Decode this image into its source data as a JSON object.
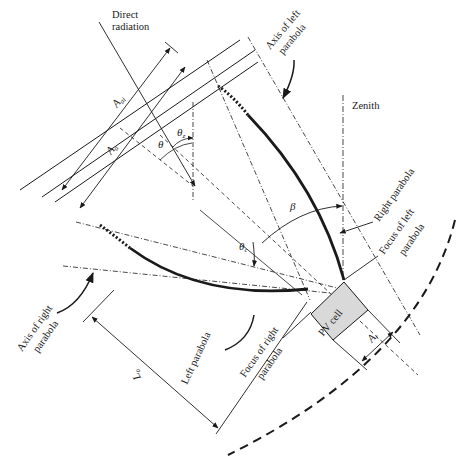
{
  "figure": {
    "background": "#ffffff",
    "line_color": "#1a1a1a",
    "cell_fill": "#d9d9d9"
  },
  "labels": {
    "direct_radiation_1": "Direct",
    "direct_radiation_2": "radiation",
    "axis_left_1": "Axis of left",
    "axis_left_2": "parabola",
    "zenith": "Zenith",
    "right_parabola": "Right parabola",
    "focus_left_1": "Focus of left",
    "focus_left_2": "parabola",
    "axis_right_1": "Axis of right",
    "axis_right_2": "parabola",
    "left_parabola": "Left parabola",
    "focus_right_1": "Focus of right",
    "focus_right_2": "parabola",
    "pv_cell": "PV cell"
  },
  "symbols": {
    "A_ai_main": "A",
    "A_ai_sub": "ai",
    "A_a_main": "A",
    "A_a_sub": "a",
    "theta": "θ",
    "theta_z_main": "θ",
    "theta_z_sub": "z",
    "theta_c_main": "θ",
    "theta_c_sub": "c",
    "beta": "β",
    "A_r_main": "A",
    "A_r_sub": "r",
    "L_a_main": "L",
    "L_a_sub": "a"
  }
}
